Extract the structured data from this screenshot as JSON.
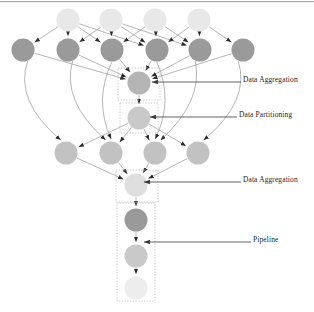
{
  "figure": {
    "background": "#ffffff",
    "border_top": "#9a9a9a"
  },
  "palette": {
    "node_lightest": "#e8e8e8",
    "node_light": "#d9d9d9",
    "node_midlight": "#c9c9c9",
    "node_mid": "#b5b5b5",
    "node_dark": "#9a9a9a",
    "node_darkest": "#8f8f8f",
    "edge": "#8c8c8c",
    "arrowhead": "#2b2b2b",
    "dashed_box": "#bdbdbd",
    "label_text": "#1d1d1d",
    "annotation_line": "#3a3a3a"
  },
  "annotations": [
    {
      "id": "ann-aggregation-top",
      "label": "Data Aggregation",
      "text_x": 243,
      "text_y": 80,
      "line_from_x": 241,
      "line_to_x": 152,
      "line_y": 82
    },
    {
      "id": "ann-partitioning",
      "label": "Data Partitioning",
      "text_x": 239,
      "text_y": 115,
      "line_from_x": 237,
      "line_to_x": 150,
      "line_y": 117
    },
    {
      "id": "ann-aggregation-bot",
      "label": "Data Aggregation",
      "text_x": 243,
      "text_y": 180,
      "line_from_x": 241,
      "line_to_x": 144,
      "line_y": 182
    },
    {
      "id": "ann-pipeline",
      "label": "Pipeline",
      "text_x": 253,
      "text_y": 240,
      "line_from_x": 251,
      "line_to_x": 144,
      "line_y": 242
    }
  ],
  "groups": [
    {
      "id": "box-aggregation-top",
      "name": "data-aggregation-box",
      "x": 118,
      "y": 68,
      "w": 42,
      "h": 32
    },
    {
      "id": "box-partitioning",
      "name": "data-partitioning-box",
      "x": 120,
      "y": 103,
      "w": 38,
      "h": 30
    },
    {
      "id": "box-aggregation-bot",
      "name": "data-aggregation-box",
      "x": 116,
      "y": 170,
      "w": 42,
      "h": 32
    },
    {
      "id": "box-pipeline",
      "name": "pipeline-box",
      "x": 117,
      "y": 203,
      "w": 38,
      "h": 98
    }
  ],
  "nodes": [
    {
      "id": "s0",
      "row": "sources",
      "label": "",
      "cx": 68,
      "cy": 20,
      "r": 11.5,
      "fill": "#e8e8e8"
    },
    {
      "id": "s1",
      "row": "sources",
      "label": "",
      "cx": 111,
      "cy": 20,
      "r": 11.5,
      "fill": "#e8e8e8"
    },
    {
      "id": "s2",
      "row": "sources",
      "label": "",
      "cx": 155,
      "cy": 20,
      "r": 11.5,
      "fill": "#e8e8e8"
    },
    {
      "id": "s3",
      "row": "sources",
      "label": "",
      "cx": 199,
      "cy": 20,
      "r": 11.5,
      "fill": "#e8e8e8"
    },
    {
      "id": "m0",
      "row": "mappers",
      "label": "",
      "cx": 23,
      "cy": 50,
      "r": 11.5,
      "fill": "#9a9a9a"
    },
    {
      "id": "m1",
      "row": "mappers",
      "label": "",
      "cx": 68,
      "cy": 50,
      "r": 11.5,
      "fill": "#9a9a9a"
    },
    {
      "id": "m2",
      "row": "mappers",
      "label": "",
      "cx": 112,
      "cy": 50,
      "r": 11.5,
      "fill": "#9a9a9a"
    },
    {
      "id": "m3",
      "row": "mappers",
      "label": "",
      "cx": 157,
      "cy": 50,
      "r": 11.5,
      "fill": "#9a9a9a"
    },
    {
      "id": "m4",
      "row": "mappers",
      "label": "",
      "cx": 200,
      "cy": 50,
      "r": 11.5,
      "fill": "#9a9a9a"
    },
    {
      "id": "m5",
      "row": "mappers",
      "label": "",
      "cx": 243,
      "cy": 50,
      "r": 11.5,
      "fill": "#9a9a9a"
    },
    {
      "id": "agg1",
      "row": "aggregate-1",
      "label": "",
      "cx": 139,
      "cy": 83,
      "r": 11.5,
      "fill": "#b5b5b5"
    },
    {
      "id": "part",
      "row": "partition",
      "label": "",
      "cx": 139,
      "cy": 118,
      "r": 11.5,
      "fill": "#c9c9c9"
    },
    {
      "id": "r0",
      "row": "reducers",
      "label": "",
      "cx": 66,
      "cy": 153,
      "r": 11.5,
      "fill": "#c2c2c2"
    },
    {
      "id": "r1",
      "row": "reducers",
      "label": "",
      "cx": 111,
      "cy": 153,
      "r": 11.5,
      "fill": "#c2c2c2"
    },
    {
      "id": "r2",
      "row": "reducers",
      "label": "",
      "cx": 155,
      "cy": 153,
      "r": 11.5,
      "fill": "#c2c2c2"
    },
    {
      "id": "r3",
      "row": "reducers",
      "label": "",
      "cx": 198,
      "cy": 153,
      "r": 11.5,
      "fill": "#c2c2c2"
    },
    {
      "id": "agg2",
      "row": "aggregate-2",
      "label": "",
      "cx": 136,
      "cy": 185,
      "r": 11.5,
      "fill": "#dedede"
    },
    {
      "id": "p0",
      "row": "pipeline",
      "label": "",
      "cx": 136,
      "cy": 220,
      "r": 11.5,
      "fill": "#9a9a9a"
    },
    {
      "id": "p1",
      "row": "pipeline",
      "label": "",
      "cx": 136,
      "cy": 256,
      "r": 11.5,
      "fill": "#c9c9c9"
    },
    {
      "id": "p2",
      "row": "pipeline",
      "label": "",
      "cx": 136,
      "cy": 288,
      "r": 11.5,
      "fill": "#ededed"
    }
  ],
  "edges": [
    {
      "from": "s0",
      "to": "m0",
      "curve": 0
    },
    {
      "from": "s0",
      "to": "m1",
      "curve": 0
    },
    {
      "from": "s0",
      "to": "m2",
      "curve": 0
    },
    {
      "from": "s0",
      "to": "m3",
      "curve": 0
    },
    {
      "from": "s1",
      "to": "m1",
      "curve": 0
    },
    {
      "from": "s1",
      "to": "m2",
      "curve": 0
    },
    {
      "from": "s1",
      "to": "m3",
      "curve": 0
    },
    {
      "from": "s1",
      "to": "m4",
      "curve": 0
    },
    {
      "from": "s2",
      "to": "m2",
      "curve": 0
    },
    {
      "from": "s2",
      "to": "m3",
      "curve": 0
    },
    {
      "from": "s2",
      "to": "m4",
      "curve": 0
    },
    {
      "from": "s3",
      "to": "m3",
      "curve": 0
    },
    {
      "from": "s3",
      "to": "m4",
      "curve": 0
    },
    {
      "from": "s3",
      "to": "m5",
      "curve": 0
    },
    {
      "from": "m0",
      "to": "agg1",
      "curve": 0
    },
    {
      "from": "m1",
      "to": "agg1",
      "curve": 0
    },
    {
      "from": "m2",
      "to": "agg1",
      "curve": 0
    },
    {
      "from": "m3",
      "to": "agg1",
      "curve": 0
    },
    {
      "from": "m4",
      "to": "agg1",
      "curve": 0
    },
    {
      "from": "m5",
      "to": "agg1",
      "curve": 0
    },
    {
      "from": "agg1",
      "to": "part",
      "curve": 0
    },
    {
      "from": "part",
      "to": "r0",
      "curve": 0
    },
    {
      "from": "part",
      "to": "r1",
      "curve": 0
    },
    {
      "from": "part",
      "to": "r2",
      "curve": 0
    },
    {
      "from": "part",
      "to": "r3",
      "curve": 0
    },
    {
      "from": "m0",
      "to": "r0",
      "curve": -30
    },
    {
      "from": "m1",
      "to": "r1",
      "curve": -28
    },
    {
      "from": "m2",
      "to": "r1",
      "curve": -18
    },
    {
      "from": "m3",
      "to": "r2",
      "curve": 18
    },
    {
      "from": "m4",
      "to": "r2",
      "curve": 26
    },
    {
      "from": "m5",
      "to": "r3",
      "curve": 30
    },
    {
      "from": "r0",
      "to": "agg2",
      "curve": 0
    },
    {
      "from": "r1",
      "to": "agg2",
      "curve": 0
    },
    {
      "from": "r2",
      "to": "agg2",
      "curve": 0
    },
    {
      "from": "r3",
      "to": "agg2",
      "curve": 0
    },
    {
      "from": "agg2",
      "to": "p0",
      "curve": 0
    },
    {
      "from": "p0",
      "to": "p1",
      "curve": 0
    },
    {
      "from": "p1",
      "to": "p2",
      "curve": 0
    }
  ]
}
